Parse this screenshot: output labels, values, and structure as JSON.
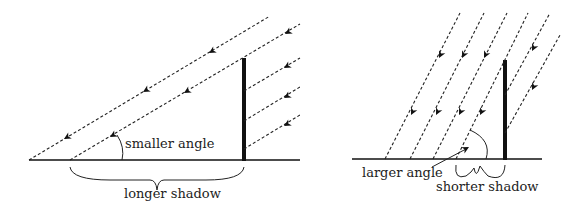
{
  "left_diagram": {
    "title": "Sun low in sky",
    "angle_label": "smaller angle",
    "shadow_label": "longer shadow"
  },
  "right_diagram": {
    "title": "Sun high in sky",
    "angle_label": "larger angle",
    "shadow_label": "shorter shadow"
  },
  "colors": {
    "line": "#111111",
    "background": "#ffffff"
  }
}
